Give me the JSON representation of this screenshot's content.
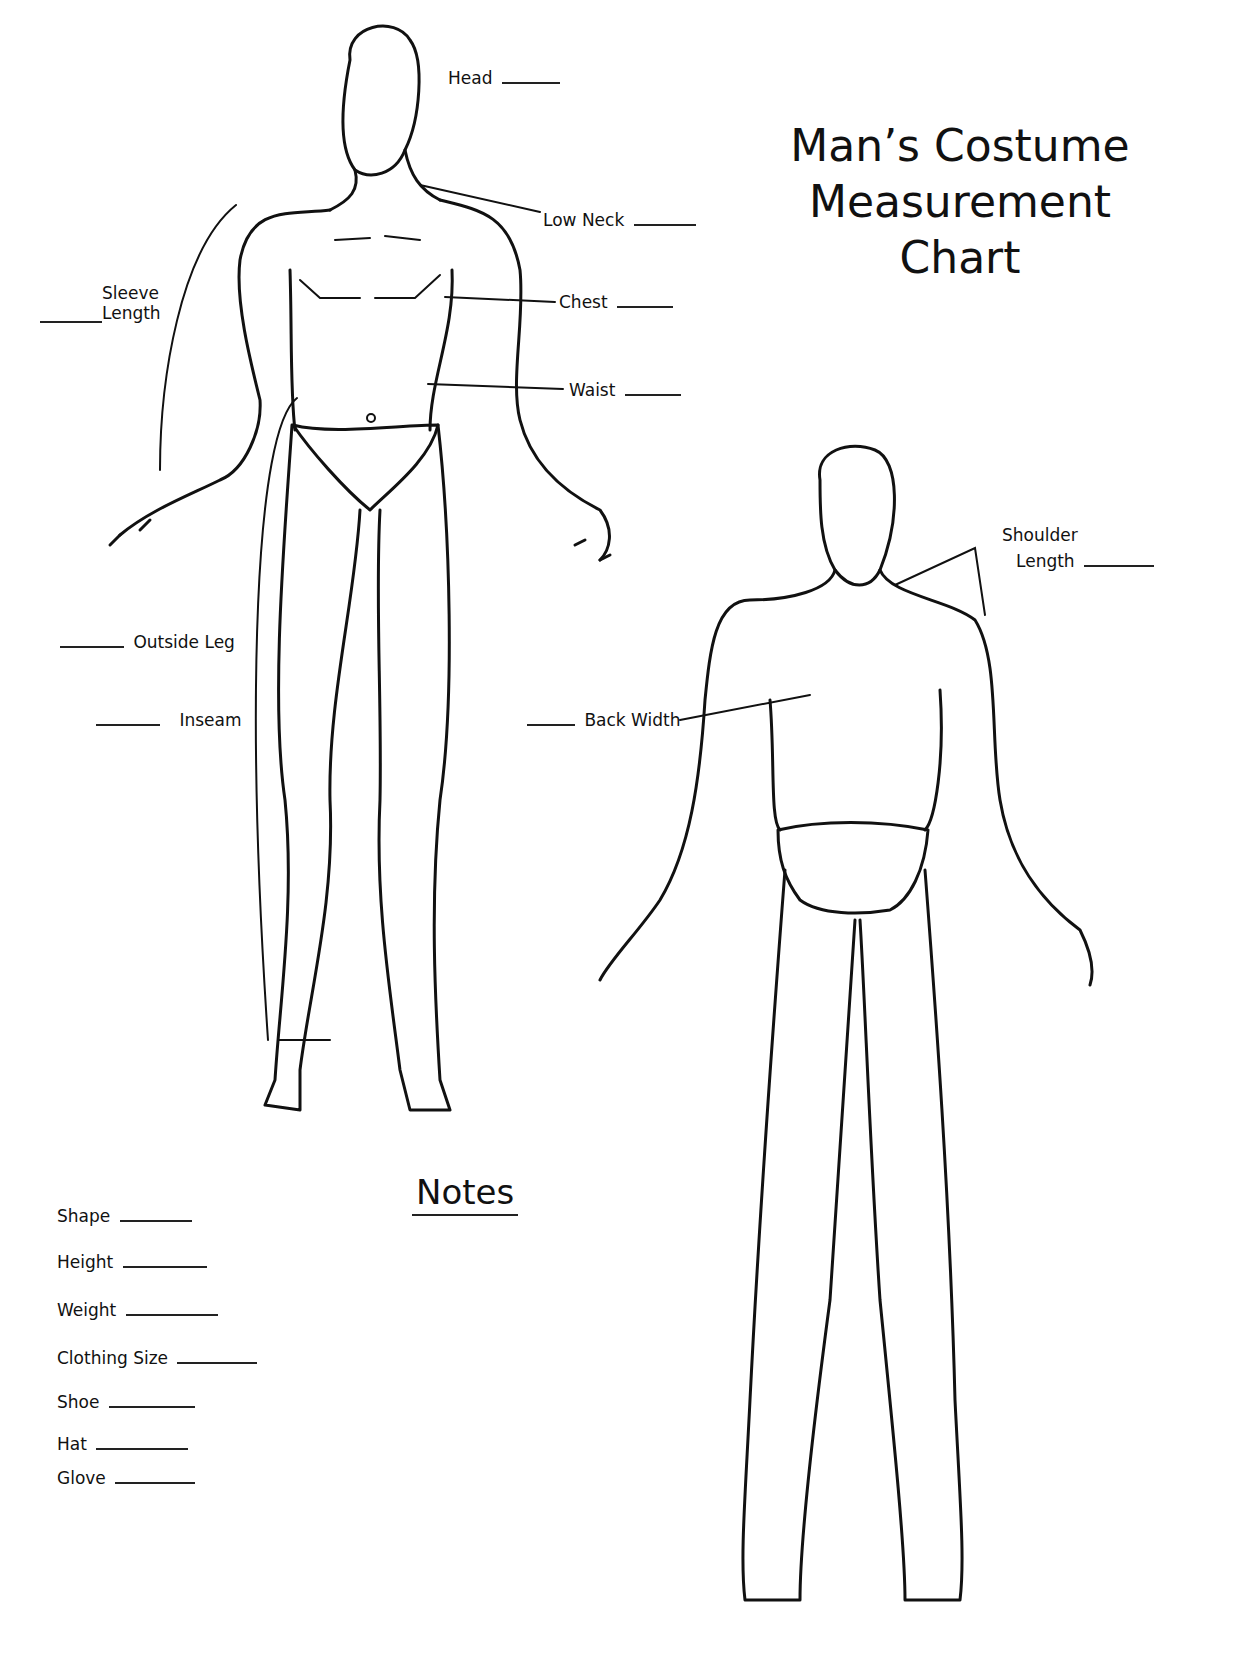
{
  "title": {
    "lines": [
      "Man’s Costume",
      "Measurement",
      "Chart"
    ]
  },
  "front_labels": {
    "head": "Head",
    "low_neck": "Low Neck",
    "sleeve_length_line1": "Sleeve",
    "sleeve_length_line2": "Length",
    "chest": "Chest",
    "waist": "Waist",
    "outside_leg": "Outside Leg",
    "inseam": "Inseam"
  },
  "back_labels": {
    "shoulder_length_line1": "Shoulder",
    "shoulder_length_line2": "Length",
    "back_width": "Back Width"
  },
  "notes": {
    "title": "Notes",
    "fields": [
      {
        "label": "Shape"
      },
      {
        "label": "Height"
      },
      {
        "label": "Weight"
      },
      {
        "label": "Clothing Size"
      },
      {
        "label": "Shoe"
      },
      {
        "label": "Hat"
      },
      {
        "label": "Glove"
      }
    ]
  }
}
